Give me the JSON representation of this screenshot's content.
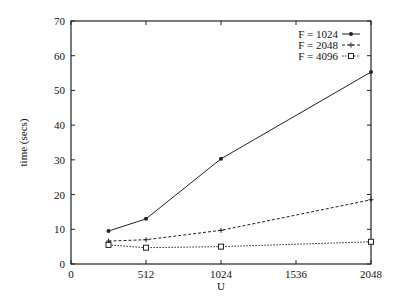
{
  "chart_data": {
    "type": "line",
    "title": "",
    "xlabel": "U",
    "ylabel": "time (secs)",
    "xlim": [
      0,
      2048
    ],
    "ylim": [
      0,
      70
    ],
    "xticks": [
      0,
      512,
      1024,
      1536,
      2048
    ],
    "yticks": [
      0,
      10,
      20,
      30,
      40,
      50,
      60,
      70
    ],
    "grid": false,
    "legend_position": "top-right",
    "x": [
      256,
      512,
      1024,
      2048
    ],
    "series": [
      {
        "name": "F = 1024",
        "marker": "filled-circle",
        "linestyle": "solid",
        "values": [
          9.5,
          13,
          30.3,
          55.3
        ]
      },
      {
        "name": "F = 2048",
        "marker": "plus",
        "linestyle": "dashed",
        "values": [
          6.6,
          7,
          9.7,
          18.5
        ]
      },
      {
        "name": "F = 4096",
        "marker": "open-square",
        "linestyle": "dotted",
        "values": [
          5.5,
          4.7,
          5,
          6.4
        ]
      }
    ]
  },
  "colors": {
    "axis": "#222222",
    "series": "#222222"
  }
}
